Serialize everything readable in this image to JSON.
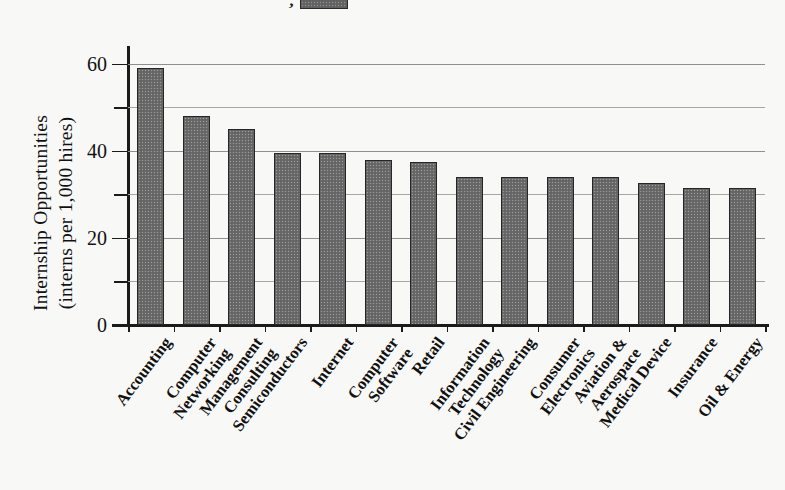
{
  "legend": {
    "comma_mark": ",",
    "swatch_color": "#666666"
  },
  "axis": {
    "y_title_line1": "Internship Opportunities",
    "y_title_line2": "(interns per 1,000 hires)",
    "y_ticks": [
      "0",
      "20",
      "40",
      "60"
    ]
  },
  "chart_data": {
    "type": "bar",
    "title": "",
    "xlabel": "",
    "ylabel": "Internship Opportunities (interns per 1,000 hires)",
    "ylim": [
      0,
      62
    ],
    "yticks": [
      0,
      20,
      40,
      60
    ],
    "minor_gridlines": [
      10,
      30,
      50
    ],
    "grid": true,
    "legend_position": "top",
    "bar_color": "#6b6b6b",
    "categories": [
      "Accounting",
      "Computer Networking",
      "Management Consulting",
      "Semiconductors",
      "Internet",
      "Computer Software",
      "Retail",
      "Information Technology",
      "Civil Engineering",
      "Consumer Electronics",
      "Aviation & Aerospace",
      "Medical Device",
      "Insurance",
      "Oil & Energy"
    ],
    "category_lines": [
      [
        "Accounting"
      ],
      [
        "Computer",
        "Networking"
      ],
      [
        "Management",
        "Consulting"
      ],
      [
        "Semiconductors"
      ],
      [
        "Internet"
      ],
      [
        "Computer",
        "Software"
      ],
      [
        "Retail"
      ],
      [
        "Information",
        "Technology"
      ],
      [
        "Civil Engineering"
      ],
      [
        "Consumer",
        "Electronics"
      ],
      [
        "Aviation &",
        "Aerospace"
      ],
      [
        "Medical Device"
      ],
      [
        "Insurance"
      ],
      [
        "Oil & Energy"
      ]
    ],
    "values": [
      59,
      48,
      45,
      39.5,
      39.5,
      38,
      37.5,
      34,
      34,
      34,
      34,
      32.5,
      31.5,
      31.5
    ]
  }
}
